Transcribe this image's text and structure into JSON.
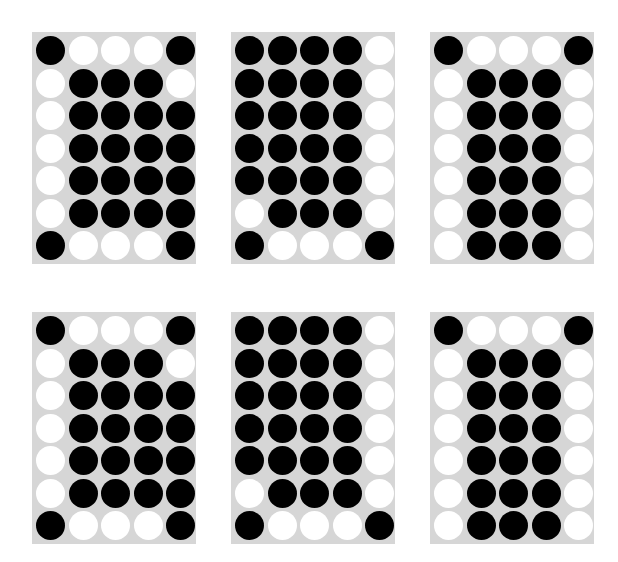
{
  "colors": {
    "background": "#ffffff",
    "panel": "#d6d6d6",
    "filled": "#000000",
    "empty": "#ffffff"
  },
  "grid": {
    "rows": 7,
    "cols": 5
  },
  "panels": [
    {
      "id": "panel-1",
      "position": "top-left",
      "x": 32,
      "y": 32,
      "pattern": [
        "BWWWB",
        "WBBBW",
        "WBBBB",
        "WBBBB",
        "WBBBB",
        "WBBBB",
        "BWWWB"
      ]
    },
    {
      "id": "panel-2",
      "position": "top-middle",
      "x": 231,
      "y": 32,
      "pattern": [
        "BBBBW",
        "BBBBW",
        "BBBBW",
        "BBBBW",
        "BBBBW",
        "WBBBW",
        "BWWWB"
      ]
    },
    {
      "id": "panel-3",
      "position": "top-right",
      "x": 430,
      "y": 32,
      "pattern": [
        "BWWWB",
        "WBBBW",
        "WBBBW",
        "WBBBW",
        "WBBBW",
        "WBBBW",
        "WBBBW"
      ]
    },
    {
      "id": "panel-4",
      "position": "bottom-left",
      "x": 32,
      "y": 312,
      "pattern": [
        "BWWWB",
        "WBBBW",
        "WBBBB",
        "WBBBB",
        "WBBBB",
        "WBBBB",
        "BWWWB"
      ]
    },
    {
      "id": "panel-5",
      "position": "bottom-middle",
      "x": 231,
      "y": 312,
      "pattern": [
        "BBBBW",
        "BBBBW",
        "BBBBW",
        "BBBBW",
        "BBBBW",
        "WBBBW",
        "BWWWB"
      ]
    },
    {
      "id": "panel-6",
      "position": "bottom-right",
      "x": 430,
      "y": 312,
      "pattern": [
        "BWWWB",
        "WBBBW",
        "WBBBW",
        "WBBBW",
        "WBBBW",
        "WBBBW",
        "WBBBW"
      ]
    }
  ]
}
